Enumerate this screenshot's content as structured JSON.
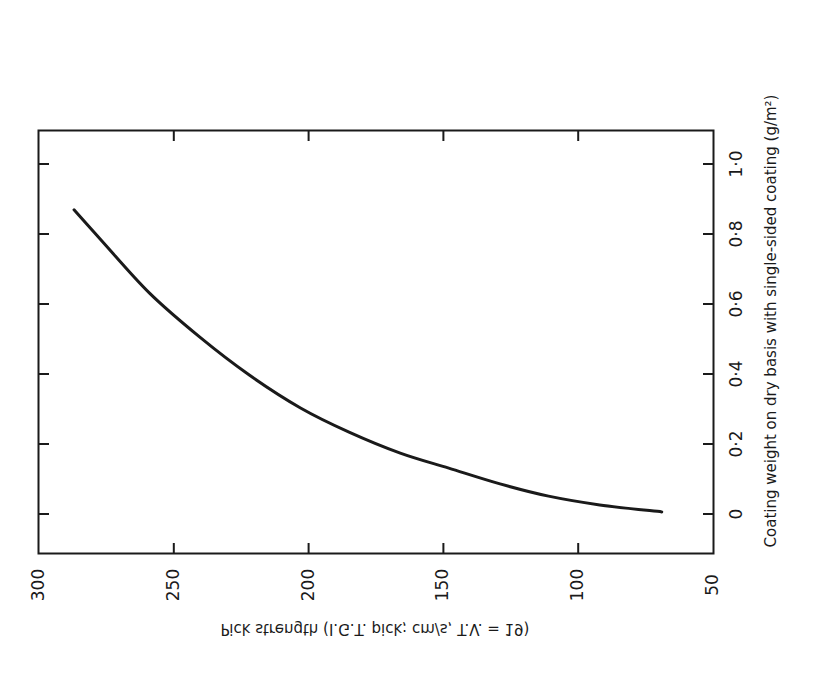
{
  "chart_data": {
    "type": "line",
    "orientation": "rotated-90",
    "title": "",
    "xlabel": "Coating weight on dry basis with single-sided coating (g/m²)",
    "ylabel": "Pick strength (I.G.T. pick; cm/s, T.V. = 19)",
    "xlim": [
      -0.1,
      1.1
    ],
    "ylim": [
      50,
      300
    ],
    "xticks": [
      "0",
      "0·2",
      "0·4",
      "0·6",
      "0·8",
      "1·0"
    ],
    "xtick_values": [
      0,
      0.2,
      0.4,
      0.6,
      0.8,
      1.0
    ],
    "yticks": [
      "50",
      "100",
      "150",
      "200",
      "250",
      "300"
    ],
    "ytick_values": [
      50,
      100,
      150,
      200,
      250,
      300
    ],
    "grid": false,
    "legend": null,
    "series": [
      {
        "name": "Pick strength vs coating weight",
        "x": [
          0.006,
          0.026,
          0.051,
          0.086,
          0.131,
          0.174,
          0.234,
          0.303,
          0.397,
          0.503,
          0.631,
          0.783,
          0.869
        ],
        "y": [
          69,
          92,
          111,
          129,
          148,
          166,
          185,
          203,
          222,
          240,
          259,
          277,
          287
        ]
      }
    ]
  },
  "colors": {
    "ink": "#1a1a1a",
    "background": "#ffffff"
  }
}
